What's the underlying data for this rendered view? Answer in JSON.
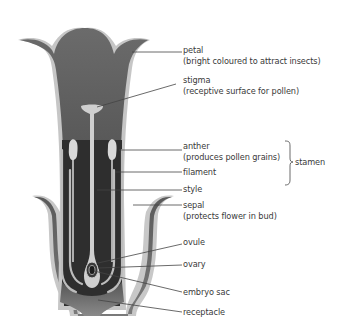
{
  "colors": {
    "tissue_dark": "#3d3d3d",
    "tissue_mid": "#6a6a6a",
    "outline_light": "#c4c4c4",
    "structure_light": "#d2d2d2",
    "label_text": "#3a3a3a",
    "leader_line": "#444444"
  },
  "labels": [
    {
      "id": "petal",
      "name": "petal",
      "description": "(bright coloured to attract insects)"
    },
    {
      "id": "stigma",
      "name": "stigma",
      "description": "(receptive surface for pollen)"
    },
    {
      "id": "anther",
      "name": "anther",
      "description": "(produces pollen grains)"
    },
    {
      "id": "filament",
      "name": "filament",
      "description": ""
    },
    {
      "id": "style",
      "name": "style",
      "description": ""
    },
    {
      "id": "sepal",
      "name": "sepal",
      "description": "(protects flower in bud)"
    },
    {
      "id": "ovule",
      "name": "ovule",
      "description": ""
    },
    {
      "id": "ovary",
      "name": "ovary",
      "description": ""
    },
    {
      "id": "embryo_sac",
      "name": "embryo sac",
      "description": ""
    },
    {
      "id": "receptacle",
      "name": "receptacle",
      "description": ""
    }
  ],
  "groups": [
    {
      "id": "stamen",
      "name": "stamen",
      "members": [
        "anther",
        "filament"
      ]
    }
  ]
}
